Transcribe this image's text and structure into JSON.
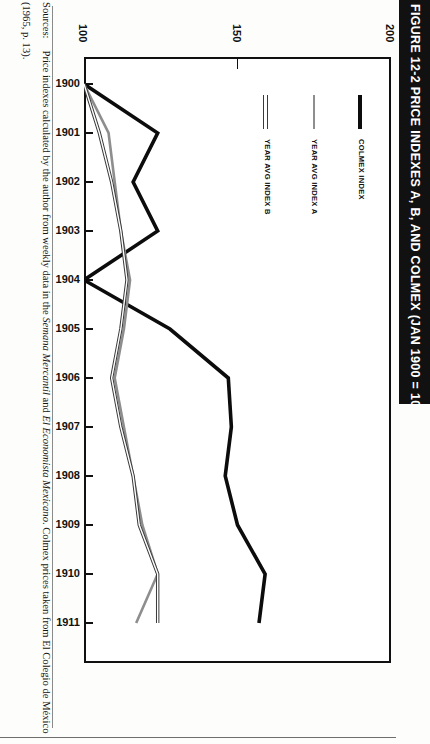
{
  "figure": {
    "title": "FIGURE 12-2  PRICE INDEXES A, B, AND COLMEX (JAN 1900 = 100)",
    "title_bg": "#111111",
    "title_fg": "#ffffff"
  },
  "sources": {
    "label": "Sources:",
    "text_part1": "Price indexes calculated by the author from weekly data in the ",
    "italic1": "Semana Mercantil",
    "text_part2": " and ",
    "italic2": "El Economista Mexicano",
    "text_part3": ". Colmex prices taken from El Colegio de México",
    "line2": "(1965, p. 13)."
  },
  "legend": {
    "items": [
      {
        "label": "COLMEX INDEX",
        "style": "thick-black",
        "color": "#0c0c0c"
      },
      {
        "label": "YEAR AVG INDEX A",
        "style": "gray",
        "color": "#8e8e8e"
      },
      {
        "label": "YEAR AVG INDEX B",
        "style": "outline",
        "color": "#3a3a3a"
      }
    ]
  },
  "chart_data": {
    "type": "line",
    "title": "FIGURE 12-2  PRICE INDEXES A, B, AND COLMEX (JAN 1900 = 100)",
    "orientation": "rotated-90-years-on-vertical-axis",
    "xlabel": "",
    "ylabel": "",
    "value_axis": {
      "name": "Price index (Jan 1900 = 100)",
      "ticks": [
        100,
        150,
        200
      ],
      "range": [
        100,
        200
      ],
      "position": "top"
    },
    "category_axis": {
      "name": "Year",
      "position": "left",
      "ticks": [
        1900,
        1901,
        1902,
        1903,
        1904,
        1905,
        1906,
        1907,
        1908,
        1909,
        1910,
        1911
      ]
    },
    "grid": false,
    "legend_position": "inside-right",
    "categories": [
      1900,
      1901,
      1902,
      1903,
      1904,
      1905,
      1906,
      1907,
      1908,
      1909,
      1910,
      1911
    ],
    "series": [
      {
        "name": "COLMEX INDEX",
        "color": "#0c0c0c",
        "values": [
          100,
          124,
          116,
          124,
          100,
          128,
          147,
          148,
          146,
          150,
          159,
          157
        ]
      },
      {
        "name": "YEAR AVG INDEX A",
        "color": "#8e8e8e",
        "values": [
          100,
          108,
          110,
          112,
          115,
          113,
          110,
          113,
          116,
          119,
          124,
          117
        ]
      },
      {
        "name": "YEAR AVG INDEX B",
        "color": "#3a3a3a",
        "values": [
          100,
          105,
          109,
          112,
          114,
          112,
          109,
          112,
          116,
          118,
          124,
          124
        ]
      }
    ]
  }
}
